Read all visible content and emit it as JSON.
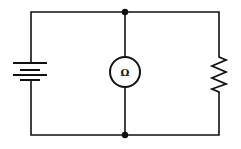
{
  "diagram": {
    "type": "circuit",
    "components": [
      {
        "id": "battery",
        "kind": "battery",
        "position": "left branch"
      },
      {
        "id": "ohmmeter",
        "kind": "meter",
        "symbol": "Ω",
        "position": "center branch"
      },
      {
        "id": "resistor",
        "kind": "resistor",
        "position": "right branch"
      }
    ],
    "junctions": [
      "top-center",
      "bottom-center"
    ],
    "meter_symbol": "Ω",
    "colors": {
      "wire": "#111111",
      "background": "#ffffff"
    }
  }
}
